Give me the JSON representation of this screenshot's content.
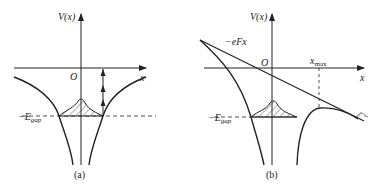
{
  "figure": {
    "panel_a": {
      "caption": "(a)",
      "y_axis_label": "V(x)",
      "x_axis_label": "x",
      "origin_label": "O",
      "gap_label": "−E",
      "gap_subscript": "gap"
    },
    "panel_b": {
      "caption": "(b)",
      "y_axis_label": "V(x)",
      "x_axis_label": "x",
      "origin_label": "O",
      "field_label": "−eFx",
      "xmax_label": "x",
      "xmax_subscript": "max",
      "gap_label": "−E",
      "gap_subscript": "gap"
    },
    "colors": {
      "ink": "#222222",
      "background": "#ffffff"
    }
  }
}
